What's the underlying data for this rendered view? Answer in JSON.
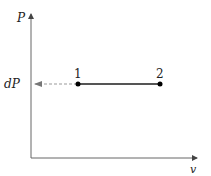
{
  "diagram": {
    "type": "pv-diagram",
    "axes": {
      "y_label": "P",
      "x_label": "v"
    },
    "marker": {
      "label": "dP"
    },
    "points": [
      {
        "label": "1"
      },
      {
        "label": "2"
      }
    ],
    "colors": {
      "axis": "#555555",
      "process_line": "#555555",
      "dashed_arrow": "#999999",
      "point": "#000000"
    }
  }
}
